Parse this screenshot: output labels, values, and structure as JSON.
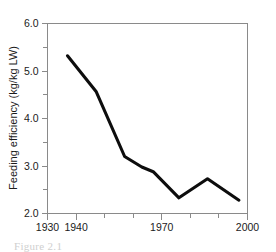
{
  "figure": {
    "background_color": "#ffffff",
    "caption_partial": "Figure 2.1"
  },
  "chart_data": {
    "type": "line",
    "title": "",
    "xlabel": "",
    "ylabel": "Feeding efficiency (kg/kg LW)",
    "xlim": [
      1930,
      2000
    ],
    "ylim": [
      2.0,
      6.0
    ],
    "grid": false,
    "legend": false,
    "line_color": "#0d0d0d",
    "frame_color": "#8a8a8a",
    "x_ticks": [
      1930,
      1940,
      1950,
      1960,
      1970,
      1980,
      1990,
      2000
    ],
    "x_tick_labels": [
      "1930",
      "1940",
      "",
      "",
      "1970",
      "",
      "",
      "2000"
    ],
    "y_ticks": [
      2.0,
      2.5,
      3.0,
      3.5,
      4.0,
      4.5,
      5.0,
      5.5,
      6.0
    ],
    "y_tick_labels": [
      "2.0",
      "",
      "3.0",
      "",
      "4.0",
      "",
      "5.0",
      "",
      "6.0"
    ],
    "series": [
      {
        "name": "Feeding efficiency",
        "x": [
          1937,
          1947,
          1957,
          1963,
          1967,
          1976,
          1986,
          1997
        ],
        "values": [
          5.32,
          4.57,
          3.2,
          2.98,
          2.88,
          2.33,
          2.73,
          2.28
        ]
      }
    ]
  }
}
